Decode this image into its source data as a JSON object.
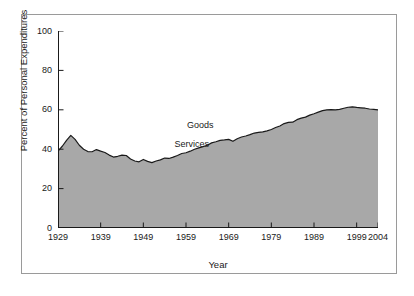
{
  "chart_data": {
    "type": "area",
    "title": "",
    "subtitle": "",
    "xlabel": "Year",
    "ylabel": "Percent of Personal Expenditures",
    "xlim": [
      1929,
      2004
    ],
    "ylim": [
      0,
      100
    ],
    "grid": false,
    "legend_position": "inline-annotation",
    "y_ticks": [
      0,
      20,
      40,
      60,
      80,
      100
    ],
    "y_tick_labels": [
      "0",
      "20",
      "40",
      "60",
      "80",
      "100"
    ],
    "x_ticks": [
      1929,
      1939,
      1949,
      1959,
      1969,
      1979,
      1989,
      1999,
      2004
    ],
    "x_tick_labels": [
      "1929",
      "1939",
      "1949",
      "1959",
      "1969",
      "1979",
      "1989",
      "1999",
      "2004"
    ],
    "annotations": [
      {
        "text": "Goods",
        "region": "above-line",
        "x": 1963,
        "y": 52
      },
      {
        "text": "Services",
        "region": "below-line",
        "x": 1961,
        "y": 42
      }
    ],
    "colors": {
      "area_fill": "#a8a8a8",
      "line": "#1a1a1a",
      "axis": "#1a1a1a",
      "frame": "#9a9a9a",
      "background": "#ffffff",
      "text": "#1a1a1a"
    },
    "series": [
      {
        "name": "Services",
        "x": [
          1929,
          1930,
          1931,
          1932,
          1933,
          1934,
          1935,
          1936,
          1937,
          1938,
          1939,
          1940,
          1941,
          1942,
          1943,
          1944,
          1945,
          1946,
          1947,
          1948,
          1949,
          1950,
          1951,
          1952,
          1953,
          1954,
          1955,
          1956,
          1957,
          1958,
          1959,
          1960,
          1961,
          1962,
          1963,
          1964,
          1965,
          1966,
          1967,
          1968,
          1969,
          1970,
          1971,
          1972,
          1973,
          1974,
          1975,
          1976,
          1977,
          1978,
          1979,
          1980,
          1981,
          1982,
          1983,
          1984,
          1985,
          1986,
          1987,
          1988,
          1989,
          1990,
          1991,
          1992,
          1993,
          1994,
          1995,
          1996,
          1997,
          1998,
          1999,
          2000,
          2001,
          2002,
          2003,
          2004
        ],
        "values": [
          39.0,
          41.5,
          44.5,
          47.0,
          45.0,
          42.0,
          40.0,
          38.8,
          38.7,
          39.8,
          39.0,
          38.3,
          37.0,
          36.0,
          36.4,
          37.0,
          36.8,
          35.0,
          34.0,
          33.6,
          34.8,
          33.8,
          33.2,
          34.0,
          34.6,
          35.5,
          35.3,
          36.0,
          36.8,
          37.8,
          38.2,
          39.0,
          40.0,
          40.7,
          41.3,
          42.0,
          43.2,
          43.8,
          44.5,
          44.7,
          45.0,
          44.0,
          45.3,
          46.2,
          46.7,
          47.4,
          48.2,
          48.5,
          48.8,
          49.3,
          50.0,
          51.0,
          51.8,
          53.0,
          53.6,
          53.7,
          55.0,
          55.8,
          56.3,
          57.3,
          58.0,
          58.8,
          59.6,
          60.0,
          60.1,
          60.0,
          60.2,
          60.8,
          61.3,
          61.5,
          61.2,
          61.0,
          60.8,
          60.4,
          60.2,
          60.0
        ]
      }
    ]
  },
  "axes": {
    "y_title": "Percent of Personal Expenditures",
    "x_title": "Year"
  }
}
